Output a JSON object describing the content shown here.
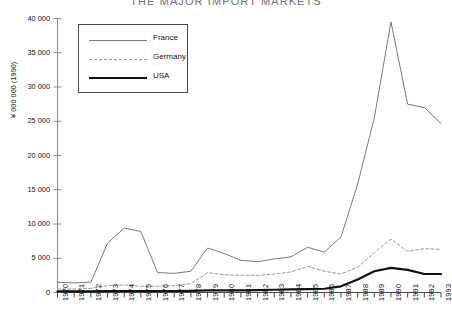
{
  "chart_data": {
    "type": "line",
    "title": "THE MAJOR IMPORT MARKETS",
    "xlabel": "",
    "ylabel": "¥ 000 000 (1990)",
    "x": [
      1970,
      1971,
      1972,
      1973,
      1974,
      1975,
      1976,
      1977,
      1978,
      1979,
      1980,
      1981,
      1982,
      1983,
      1984,
      1985,
      1986,
      1987,
      1988,
      1989,
      1990,
      1991,
      1992,
      1993
    ],
    "xtick_labels": [
      "1970",
      "1971",
      "1972",
      "1973",
      "1974",
      "1975",
      "1976",
      "1977",
      "1978",
      "1979",
      "1980",
      "1981",
      "1982",
      "1983",
      "1984",
      "1985",
      "1986",
      "1987",
      "1988",
      "1989",
      "1990",
      "1991",
      "1992",
      "1993"
    ],
    "ytick_labels": [
      "0",
      "5 000",
      "10 000",
      "15 000",
      "20 000",
      "25 000",
      "30 000",
      "35 000",
      "40 000"
    ],
    "ytick_values": [
      0,
      5000,
      10000,
      15000,
      20000,
      25000,
      30000,
      35000,
      40000
    ],
    "ylim": [
      0,
      40000
    ],
    "xlim": [
      1970,
      1993
    ],
    "grid": false,
    "legend_position": "upper-left",
    "series": [
      {
        "name": "France",
        "style": "thin-solid",
        "color": "#7a7a7a",
        "values": [
          1500,
          1400,
          1500,
          7200,
          9400,
          8900,
          2900,
          2800,
          3100,
          6500,
          5700,
          4700,
          4500,
          4900,
          5200,
          6600,
          5900,
          8100,
          15800,
          25500,
          39500,
          27500,
          27000,
          24700
        ]
      },
      {
        "name": "Germany",
        "style": "dashed",
        "color": "#9a9a9a",
        "values": [
          500,
          500,
          600,
          1000,
          1100,
          900,
          900,
          1000,
          1300,
          2900,
          2600,
          2500,
          2500,
          2700,
          3000,
          3800,
          3100,
          2700,
          3700,
          5800,
          7800,
          6000,
          6400,
          6300
        ]
      },
      {
        "name": "USA",
        "style": "thick-solid",
        "color": "#111111",
        "values": [
          150,
          150,
          150,
          200,
          200,
          200,
          200,
          200,
          250,
          300,
          300,
          300,
          350,
          400,
          450,
          500,
          550,
          900,
          1900,
          3100,
          3600,
          3300,
          2700,
          2700
        ]
      }
    ]
  },
  "legend": {
    "entries": [
      {
        "label": "France"
      },
      {
        "label": "Germany"
      },
      {
        "label": "USA"
      }
    ]
  }
}
